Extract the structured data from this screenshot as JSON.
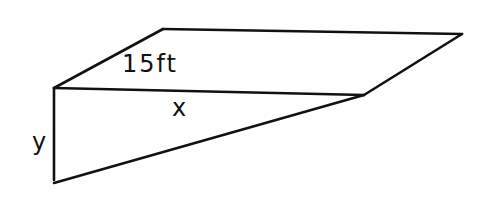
{
  "diagram": {
    "stroke_color": "#111111",
    "background": "#ffffff",
    "vertices": {
      "front_top_left": [
        54,
        88
      ],
      "back_top_left": [
        163,
        29
      ],
      "back_top_right": [
        462,
        34
      ],
      "front_top_right": [
        364,
        95
      ],
      "front_bottom_left": [
        54,
        183
      ]
    },
    "labels": {
      "slant": "15ft",
      "horizontal": "x",
      "vertical": "y"
    }
  }
}
